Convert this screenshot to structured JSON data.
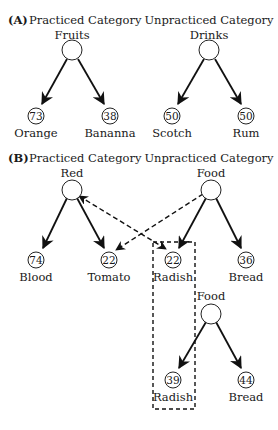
{
  "panel_a": {
    "label": "(A)",
    "practiced": {
      "title": "Practiced Category",
      "category": "Fruits",
      "leaves": [
        {
          "value": "73",
          "label": "Orange"
        },
        {
          "value": "38",
          "label": "Bananna"
        }
      ]
    },
    "unpracticed": {
      "title": "Unpracticed Category",
      "category": "Drinks",
      "leaves": [
        {
          "value": "50",
          "label": "Scotch"
        },
        {
          "value": "50",
          "label": "Rum"
        }
      ]
    }
  },
  "panel_b": {
    "label": "(B)",
    "practiced": {
      "title": "Practiced Category",
      "category": "Red",
      "leaves": [
        {
          "value": "74",
          "label": "Blood"
        },
        {
          "value": "22",
          "label": "Tomato"
        }
      ]
    },
    "unpracticed": {
      "title": "Unpracticed Category",
      "category": "Food",
      "leaves": [
        {
          "value": "22",
          "label": "Radish"
        },
        {
          "value": "36",
          "label": "Bread"
        }
      ]
    },
    "second_food": {
      "category": "Food",
      "leaves": [
        {
          "value": "39",
          "label": "Radish"
        },
        {
          "value": "44",
          "label": "Bread"
        }
      ]
    }
  }
}
